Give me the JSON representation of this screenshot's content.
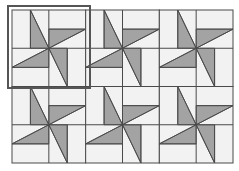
{
  "diagram": {
    "type": "quilt-pattern",
    "grid": {
      "columns": 3,
      "rows": 2,
      "left": 12,
      "top": 10,
      "right": 233,
      "bottom": 163
    },
    "colors": {
      "background": "#f2f2f2",
      "fill": "#a3a3a3",
      "line": "#4a4a4a",
      "selection": "#555555"
    },
    "selection": {
      "block_index": 0,
      "x": 8,
      "y": 6,
      "width": 82,
      "height": 82
    },
    "blocks": [
      {
        "row": 0,
        "col": 0,
        "label": "block-1"
      },
      {
        "row": 0,
        "col": 1,
        "label": "block-2"
      },
      {
        "row": 0,
        "col": 2,
        "label": "block-3"
      },
      {
        "row": 1,
        "col": 0,
        "label": "block-4"
      },
      {
        "row": 1,
        "col": 1,
        "label": "block-5"
      },
      {
        "row": 1,
        "col": 2,
        "label": "block-6"
      }
    ]
  }
}
